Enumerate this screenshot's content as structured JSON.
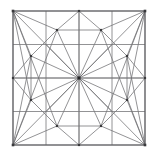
{
  "figure": {
    "type": "geometric-line-diagram",
    "canvas": {
      "width": 156,
      "height": 156,
      "background": "#ffffff"
    },
    "colors": {
      "edge": "#6f6f72",
      "frame": "#5a5a5e",
      "grid": "#77777a",
      "node": "#3a3a3d",
      "hub": "#262628"
    },
    "frame": {
      "x0": 13,
      "y0": 11,
      "x1": 145,
      "y1": 145
    },
    "grid": {
      "divisions": 4,
      "x_positions": [
        13,
        46,
        79,
        112,
        145
      ],
      "y_positions": [
        11,
        44.5,
        78,
        111.5,
        145
      ]
    },
    "nodes": [
      {
        "name": "corner-top-left",
        "x": 13,
        "y": 11,
        "size": 2.6
      },
      {
        "name": "corner-top-right",
        "x": 145,
        "y": 11,
        "size": 2.6
      },
      {
        "name": "corner-bottom-left",
        "x": 13,
        "y": 145,
        "size": 2.6
      },
      {
        "name": "corner-bottom-right",
        "x": 145,
        "y": 145,
        "size": 2.6
      },
      {
        "name": "edge-top-mid",
        "x": 79,
        "y": 11,
        "size": 2.2
      },
      {
        "name": "edge-bottom-mid",
        "x": 79,
        "y": 145,
        "size": 2.2
      },
      {
        "name": "edge-left-mid",
        "x": 13,
        "y": 78,
        "size": 2.2
      },
      {
        "name": "edge-right-mid",
        "x": 145,
        "y": 78,
        "size": 2.2
      },
      {
        "name": "inner-top-left",
        "x": 57,
        "y": 30,
        "size": 2.2
      },
      {
        "name": "inner-top-right",
        "x": 101,
        "y": 30,
        "size": 2.2
      },
      {
        "name": "inner-bottom-left",
        "x": 57,
        "y": 126,
        "size": 2.2
      },
      {
        "name": "inner-bottom-right",
        "x": 101,
        "y": 126,
        "size": 2.2
      },
      {
        "name": "inner-left-top",
        "x": 31,
        "y": 56,
        "size": 2.2
      },
      {
        "name": "inner-left-bottom",
        "x": 31,
        "y": 100,
        "size": 2.2
      },
      {
        "name": "inner-right-top",
        "x": 127,
        "y": 56,
        "size": 2.2
      },
      {
        "name": "inner-right-bottom",
        "x": 127,
        "y": 100,
        "size": 2.2
      },
      {
        "name": "center-hub",
        "x": 79,
        "y": 78,
        "size": 3.0
      }
    ],
    "frame_edges": [
      [
        13,
        11,
        145,
        11
      ],
      [
        145,
        11,
        145,
        145
      ],
      [
        145,
        145,
        13,
        145
      ],
      [
        13,
        145,
        13,
        11
      ]
    ],
    "grid_edges": [
      [
        46,
        11,
        46,
        145
      ],
      [
        79,
        11,
        79,
        145
      ],
      [
        112,
        11,
        112,
        145
      ],
      [
        13,
        44.5,
        145,
        44.5
      ],
      [
        13,
        78,
        145,
        78
      ],
      [
        13,
        111.5,
        145,
        111.5
      ]
    ],
    "mesh_edges": [
      [
        13,
        11,
        31,
        56
      ],
      [
        13,
        11,
        57,
        30
      ],
      [
        13,
        11,
        79,
        78
      ],
      [
        13,
        11,
        31,
        100
      ],
      [
        13,
        11,
        57,
        126
      ],
      [
        13,
        11,
        13,
        78
      ],
      [
        13,
        11,
        79,
        11
      ],
      [
        145,
        11,
        127,
        56
      ],
      [
        145,
        11,
        101,
        30
      ],
      [
        145,
        11,
        79,
        78
      ],
      [
        145,
        11,
        127,
        100
      ],
      [
        145,
        11,
        101,
        126
      ],
      [
        145,
        11,
        145,
        78
      ],
      [
        145,
        11,
        79,
        11
      ],
      [
        13,
        145,
        31,
        100
      ],
      [
        13,
        145,
        57,
        126
      ],
      [
        13,
        145,
        79,
        78
      ],
      [
        13,
        145,
        31,
        56
      ],
      [
        13,
        145,
        57,
        30
      ],
      [
        13,
        145,
        13,
        78
      ],
      [
        13,
        145,
        79,
        145
      ],
      [
        145,
        145,
        127,
        100
      ],
      [
        145,
        145,
        101,
        126
      ],
      [
        145,
        145,
        79,
        78
      ],
      [
        145,
        145,
        127,
        56
      ],
      [
        145,
        145,
        101,
        30
      ],
      [
        145,
        145,
        145,
        78
      ],
      [
        145,
        145,
        79,
        145
      ],
      [
        79,
        11,
        57,
        30
      ],
      [
        79,
        11,
        101,
        30
      ],
      [
        79,
        11,
        79,
        78
      ],
      [
        79,
        145,
        57,
        126
      ],
      [
        79,
        145,
        101,
        126
      ],
      [
        79,
        145,
        79,
        78
      ],
      [
        13,
        78,
        31,
        56
      ],
      [
        13,
        78,
        31,
        100
      ],
      [
        13,
        78,
        79,
        78
      ],
      [
        145,
        78,
        127,
        56
      ],
      [
        145,
        78,
        127,
        100
      ],
      [
        145,
        78,
        79,
        78
      ],
      [
        57,
        30,
        79,
        78
      ],
      [
        101,
        30,
        79,
        78
      ],
      [
        57,
        126,
        79,
        78
      ],
      [
        101,
        126,
        79,
        78
      ],
      [
        31,
        56,
        79,
        78
      ],
      [
        31,
        100,
        79,
        78
      ],
      [
        127,
        56,
        79,
        78
      ],
      [
        127,
        100,
        79,
        78
      ],
      [
        57,
        30,
        31,
        56
      ],
      [
        101,
        30,
        127,
        56
      ],
      [
        57,
        126,
        31,
        100
      ],
      [
        101,
        126,
        127,
        100
      ],
      [
        57,
        30,
        101,
        30
      ],
      [
        57,
        126,
        101,
        126
      ],
      [
        31,
        56,
        31,
        100
      ],
      [
        127,
        56,
        127,
        100
      ],
      [
        46,
        44.5,
        79,
        78
      ],
      [
        112,
        44.5,
        79,
        78
      ],
      [
        46,
        111.5,
        79,
        78
      ],
      [
        112,
        111.5,
        79,
        78
      ]
    ]
  }
}
